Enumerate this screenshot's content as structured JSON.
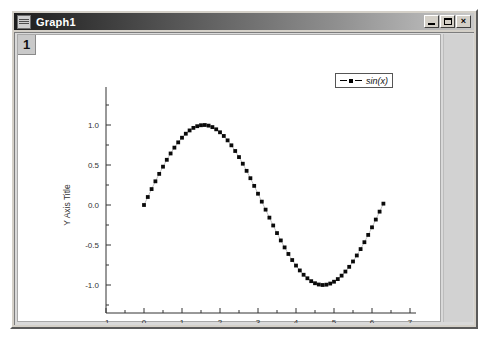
{
  "window": {
    "title": "Graph1",
    "sys_icon": "graph-window-icon",
    "buttons": {
      "minimize": "_",
      "maximize": "□",
      "close": "×"
    }
  },
  "client": {
    "layer_button_label": "1"
  },
  "legend": {
    "entries": [
      {
        "label": "sin(x)",
        "marker": "square",
        "line": "dashed",
        "color": "#000000"
      }
    ]
  },
  "chart_data": {
    "type": "scatter",
    "title": "",
    "xlabel": "X Axis Title",
    "ylabel": "Y Axis Title",
    "xlim": [
      -1,
      7
    ],
    "ylim": [
      -1.35,
      1.35
    ],
    "xticks": [
      -1,
      0,
      1,
      2,
      3,
      4,
      5,
      6,
      7
    ],
    "xticklabels": [
      "-1",
      "0",
      "1",
      "2",
      "3",
      "4",
      "5",
      "6",
      "7"
    ],
    "yticks": [
      -1.0,
      -0.5,
      0.0,
      0.5,
      1.0
    ],
    "yticklabels": [
      "-1.0",
      "-0.5",
      "0.0",
      "0.5",
      "1.0"
    ],
    "minor_ticks": true,
    "grid": false,
    "legend_position": "top-right",
    "series": [
      {
        "name": "sin(x)",
        "marker": "square",
        "marker_color": "#000000",
        "line": "dashed",
        "x": [
          0,
          0.1,
          0.2,
          0.3,
          0.4,
          0.5,
          0.6,
          0.7,
          0.8,
          0.9,
          1.0,
          1.1,
          1.2,
          1.3,
          1.4,
          1.5,
          1.6,
          1.7,
          1.8,
          1.9,
          2.0,
          2.1,
          2.2,
          2.3,
          2.4,
          2.5,
          2.6,
          2.7,
          2.8,
          2.9,
          3.0,
          3.1,
          3.2,
          3.3,
          3.4,
          3.5,
          3.6,
          3.7,
          3.8,
          3.9,
          4.0,
          4.1,
          4.2,
          4.3,
          4.4,
          4.5,
          4.6,
          4.7,
          4.8,
          4.9,
          5.0,
          5.1,
          5.2,
          5.3,
          5.4,
          5.5,
          5.6,
          5.7,
          5.8,
          5.9,
          6.0,
          6.1,
          6.2,
          6.3
        ],
        "y": [
          0.0,
          0.1,
          0.199,
          0.296,
          0.389,
          0.479,
          0.565,
          0.644,
          0.717,
          0.783,
          0.841,
          0.891,
          0.932,
          0.964,
          0.985,
          0.997,
          1.0,
          0.992,
          0.974,
          0.946,
          0.909,
          0.863,
          0.808,
          0.746,
          0.675,
          0.599,
          0.516,
          0.427,
          0.335,
          0.239,
          0.141,
          0.042,
          -0.058,
          -0.158,
          -0.256,
          -0.351,
          -0.443,
          -0.53,
          -0.612,
          -0.688,
          -0.757,
          -0.818,
          -0.872,
          -0.916,
          -0.952,
          -0.978,
          -0.994,
          -1.0,
          -0.996,
          -0.982,
          -0.959,
          -0.926,
          -0.883,
          -0.832,
          -0.773,
          -0.706,
          -0.631,
          -0.551,
          -0.465,
          -0.374,
          -0.279,
          -0.182,
          -0.083,
          0.017
        ]
      }
    ]
  }
}
